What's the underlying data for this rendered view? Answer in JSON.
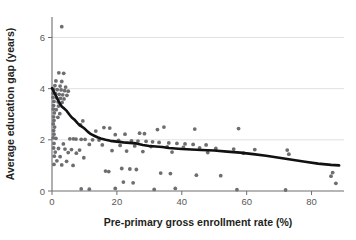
{
  "chart_data": {
    "type": "scatter",
    "title": "",
    "xlabel": "Pre-primary gross enrollment rate (%)",
    "ylabel": "Average education gap (years)",
    "xlim": [
      0,
      90
    ],
    "ylim": [
      0,
      6.8
    ],
    "xticks": [
      0,
      20,
      40,
      60,
      80
    ],
    "xtick_labels": [
      "0",
      "20",
      "40",
      "60",
      "80"
    ],
    "yticks": [
      0,
      2,
      4,
      6
    ],
    "ytick_labels": [
      "0",
      "2",
      "4",
      "6"
    ],
    "grid": "horizontal",
    "gridlines_y": [
      2,
      4,
      6
    ],
    "legend": "none",
    "series": [
      {
        "name": "Countries",
        "type": "scatter",
        "marker": "circle",
        "color": "#6e6e70",
        "points": [
          [
            3.0,
            6.42
          ],
          [
            2.1,
            4.62
          ],
          [
            3.6,
            4.6
          ],
          [
            1.2,
            4.3
          ],
          [
            3.0,
            4.28
          ],
          [
            0.9,
            4.12
          ],
          [
            2.5,
            4.1
          ],
          [
            4.2,
            4.06
          ],
          [
            0.5,
            3.98
          ],
          [
            1.6,
            3.96
          ],
          [
            2.8,
            3.95
          ],
          [
            3.9,
            3.92
          ],
          [
            5.0,
            3.9
          ],
          [
            0.4,
            3.82
          ],
          [
            1.1,
            3.8
          ],
          [
            2.2,
            3.78
          ],
          [
            3.3,
            3.76
          ],
          [
            4.6,
            3.74
          ],
          [
            0.3,
            3.66
          ],
          [
            1.4,
            3.64
          ],
          [
            2.6,
            3.62
          ],
          [
            3.7,
            3.6
          ],
          [
            0.6,
            3.5
          ],
          [
            1.9,
            3.48
          ],
          [
            3.1,
            3.46
          ],
          [
            0.5,
            3.34
          ],
          [
            2.0,
            3.32
          ],
          [
            0.4,
            3.2
          ],
          [
            1.3,
            3.18
          ],
          [
            0.7,
            3.05
          ],
          [
            2.4,
            3.02
          ],
          [
            0.5,
            2.9
          ],
          [
            1.8,
            2.88
          ],
          [
            0.6,
            2.76
          ],
          [
            9.5,
            2.74
          ],
          [
            0.4,
            2.62
          ],
          [
            8.8,
            2.58
          ],
          [
            0.8,
            2.5
          ],
          [
            16.0,
            2.48
          ],
          [
            17.8,
            2.46
          ],
          [
            0.5,
            2.36
          ],
          [
            13.5,
            2.34
          ],
          [
            0.6,
            2.22
          ],
          [
            19.5,
            2.2
          ],
          [
            22.5,
            2.22
          ],
          [
            27.0,
            2.26
          ],
          [
            28.5,
            2.24
          ],
          [
            32.5,
            2.4
          ],
          [
            34.5,
            2.5
          ],
          [
            44.0,
            2.42
          ],
          [
            57.5,
            2.44
          ],
          [
            0.4,
            2.08
          ],
          [
            1.2,
            2.06
          ],
          [
            5.5,
            2.04
          ],
          [
            6.6,
            2.04
          ],
          [
            7.4,
            2.03
          ],
          [
            9.0,
            2.02
          ],
          [
            10.2,
            2.02
          ],
          [
            12.5,
            2.0
          ],
          [
            14.5,
            1.99
          ],
          [
            20.5,
            1.98
          ],
          [
            24.5,
            1.96
          ],
          [
            26.5,
            1.95
          ],
          [
            29.0,
            1.94
          ],
          [
            31.0,
            1.92
          ],
          [
            33.0,
            1.9
          ],
          [
            36.0,
            1.88
          ],
          [
            38.5,
            1.86
          ],
          [
            41.0,
            1.84
          ],
          [
            43.5,
            1.82
          ],
          [
            47.5,
            1.8
          ],
          [
            0.6,
            1.86
          ],
          [
            3.5,
            1.84
          ],
          [
            11.5,
            1.82
          ],
          [
            15.5,
            1.8
          ],
          [
            21.0,
            1.78
          ],
          [
            25.5,
            1.76
          ],
          [
            30.5,
            1.74
          ],
          [
            35.5,
            1.72
          ],
          [
            40.5,
            1.7
          ],
          [
            45.5,
            1.68
          ],
          [
            50.5,
            1.66
          ],
          [
            56.0,
            1.64
          ],
          [
            62.5,
            1.62
          ],
          [
            72.5,
            1.6
          ],
          [
            73.0,
            1.44
          ],
          [
            0.5,
            1.68
          ],
          [
            2.0,
            1.66
          ],
          [
            4.0,
            1.64
          ],
          [
            6.0,
            1.62
          ],
          [
            8.5,
            1.6
          ],
          [
            18.5,
            1.58
          ],
          [
            23.0,
            1.56
          ],
          [
            28.0,
            1.54
          ],
          [
            37.0,
            1.52
          ],
          [
            48.0,
            1.5
          ],
          [
            59.0,
            1.48
          ],
          [
            1.0,
            1.52
          ],
          [
            5.0,
            1.5
          ],
          [
            7.5,
            1.48
          ],
          [
            0.7,
            1.36
          ],
          [
            2.5,
            1.34
          ],
          [
            9.8,
            1.3
          ],
          [
            1.5,
            1.18
          ],
          [
            4.5,
            1.16
          ],
          [
            0.6,
            1.04
          ],
          [
            3.0,
            1.02
          ],
          [
            6.5,
            1.0
          ],
          [
            16.5,
            0.78
          ],
          [
            17.5,
            0.76
          ],
          [
            21.5,
            0.88
          ],
          [
            24.0,
            0.86
          ],
          [
            26.0,
            0.84
          ],
          [
            33.5,
            0.7
          ],
          [
            36.5,
            0.68
          ],
          [
            44.5,
            0.62
          ],
          [
            52.0,
            0.6
          ],
          [
            86.0,
            0.58
          ],
          [
            9.0,
            0.08
          ],
          [
            11.5,
            0.07
          ],
          [
            19.5,
            0.1
          ],
          [
            22.0,
            0.35
          ],
          [
            25.0,
            0.32
          ],
          [
            31.5,
            0.06
          ],
          [
            38.0,
            0.1
          ],
          [
            57.0,
            0.05
          ],
          [
            72.0,
            0.04
          ],
          [
            87.5,
            0.3
          ],
          [
            86.5,
            0.72
          ]
        ]
      },
      {
        "name": "Smoothed trend",
        "type": "line",
        "color": "#111111",
        "points": [
          [
            0.0,
            4.02
          ],
          [
            0.8,
            3.82
          ],
          [
            1.6,
            3.62
          ],
          [
            2.3,
            3.44
          ],
          [
            3.0,
            3.3
          ],
          [
            3.8,
            3.22
          ],
          [
            4.6,
            3.12
          ],
          [
            5.4,
            2.98
          ],
          [
            6.2,
            2.86
          ],
          [
            7.0,
            2.78
          ],
          [
            7.8,
            2.66
          ],
          [
            8.6,
            2.56
          ],
          [
            9.4,
            2.5
          ],
          [
            10.2,
            2.42
          ],
          [
            11.0,
            2.32
          ],
          [
            12.0,
            2.22
          ],
          [
            13.0,
            2.16
          ],
          [
            14.0,
            2.1
          ],
          [
            15.0,
            2.05
          ],
          [
            16.5,
            2.0
          ],
          [
            18.0,
            1.96
          ],
          [
            20.0,
            1.93
          ],
          [
            22.0,
            1.9
          ],
          [
            24.0,
            1.88
          ],
          [
            26.0,
            1.86
          ],
          [
            28.0,
            1.8
          ],
          [
            30.0,
            1.76
          ],
          [
            32.0,
            1.74
          ],
          [
            34.0,
            1.72
          ],
          [
            36.0,
            1.68
          ],
          [
            38.0,
            1.66
          ],
          [
            40.0,
            1.64
          ],
          [
            43.0,
            1.62
          ],
          [
            46.0,
            1.6
          ],
          [
            50.0,
            1.58
          ],
          [
            54.0,
            1.54
          ],
          [
            58.0,
            1.5
          ],
          [
            62.0,
            1.44
          ],
          [
            66.0,
            1.38
          ],
          [
            70.0,
            1.3
          ],
          [
            74.0,
            1.22
          ],
          [
            78.0,
            1.14
          ],
          [
            82.0,
            1.07
          ],
          [
            86.0,
            1.02
          ],
          [
            88.5,
            1.0
          ]
        ]
      }
    ]
  },
  "axes": {
    "x_title": "Pre-primary gross enrollment rate (%)",
    "y_title": "Average education gap (years)"
  }
}
